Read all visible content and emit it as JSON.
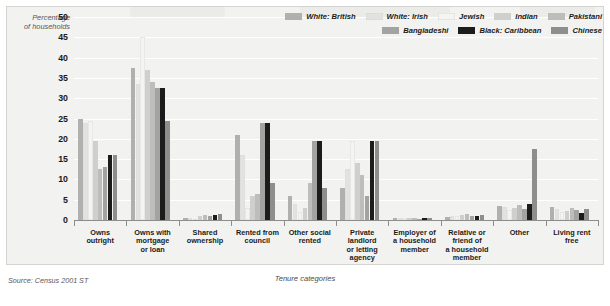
{
  "ylabel_line1": "Percentage",
  "ylabel_line2": "of households",
  "xaxis_title": "Tenure categories",
  "source": "Source: Census 2001 ST",
  "legend": {
    "row1": [
      {
        "label": "White: British",
        "color": "#b0b0ae"
      },
      {
        "label": "White: Irish",
        "color": "#e2e2e0"
      },
      {
        "label": "Jewish",
        "color": "#f4f4f2"
      },
      {
        "label": "Indian",
        "color": "#cfcfcd"
      },
      {
        "label": "Pakistani",
        "color": "#bdbdbb"
      }
    ],
    "row2": [
      {
        "label": "Bangladeshi",
        "color": "#a3a3a1"
      },
      {
        "label": "Black: Caribbean",
        "color": "#1c1c1c"
      },
      {
        "label": "Chinese",
        "color": "#8e8e8c"
      }
    ]
  },
  "chart_data": {
    "type": "bar",
    "title": "",
    "xlabel": "Tenure categories",
    "ylabel": "Percentage of households",
    "ylim": [
      0,
      50
    ],
    "yticks": [
      0,
      5,
      10,
      15,
      20,
      25,
      30,
      35,
      40,
      45,
      50
    ],
    "grid": true,
    "legend_position": "top-right",
    "categories": [
      "Owns outright",
      "Owns with mortgage or loan",
      "Shared ownership",
      "Rented from council",
      "Other social rented",
      "Private landlord or letting agency",
      "Employer of a household member",
      "Relative or friend of a household member",
      "Other",
      "Living rent free"
    ],
    "category_lines": [
      [
        "Owns",
        "outright"
      ],
      [
        "Owns with",
        "mortgage",
        "or loan"
      ],
      [
        "Shared",
        "ownership"
      ],
      [
        "Rented from",
        "council"
      ],
      [
        "Other social",
        "rented"
      ],
      [
        "Private",
        "landlord",
        "or letting",
        "agency"
      ],
      [
        "Employer of",
        "a household",
        "member"
      ],
      [
        "Relative or",
        "friend of",
        "a household",
        "member"
      ],
      [
        "Other"
      ],
      [
        "Living rent",
        "free"
      ]
    ],
    "series": [
      {
        "name": "White: British",
        "color": "#b0b0ae",
        "values": [
          25.0,
          37.5,
          0.6,
          21.0,
          6.0,
          8.0,
          0.6,
          0.8,
          3.5,
          3.2
        ]
      },
      {
        "name": "White: Irish",
        "color": "#e2e2e0",
        "values": [
          24.0,
          33.5,
          0.4,
          16.0,
          4.0,
          12.5,
          0.5,
          1.0,
          3.2,
          2.6
        ]
      },
      {
        "name": "Jewish",
        "color": "#f4f4f2",
        "values": [
          24.5,
          45.0,
          0.3,
          3.0,
          2.0,
          19.5,
          0.4,
          0.9,
          2.5,
          2.0
        ]
      },
      {
        "name": "Indian",
        "color": "#cfcfcd",
        "values": [
          19.5,
          37.0,
          1.1,
          6.0,
          3.0,
          14.0,
          0.5,
          1.2,
          3.0,
          2.2
        ]
      },
      {
        "name": "Pakistani",
        "color": "#bdbdbb",
        "values": [
          12.5,
          34.0,
          1.3,
          6.5,
          9.0,
          11.0,
          0.4,
          1.5,
          3.8,
          3.0
        ]
      },
      {
        "name": "Bangladeshi",
        "color": "#a3a3a1",
        "values": [
          13.0,
          32.5,
          1.0,
          24.0,
          19.5,
          6.0,
          0.3,
          1.0,
          2.8,
          2.4
        ]
      },
      {
        "name": "Black: Caribbean",
        "color": "#1c1c1c",
        "values": [
          16.0,
          32.5,
          1.2,
          24.0,
          19.5,
          19.5,
          0.4,
          1.1,
          4.0,
          1.8
        ]
      },
      {
        "name": "Chinese",
        "color": "#8e8e8c",
        "values": [
          16.0,
          24.5,
          1.5,
          9.0,
          8.0,
          19.5,
          0.6,
          1.3,
          17.5,
          2.8
        ]
      }
    ]
  }
}
